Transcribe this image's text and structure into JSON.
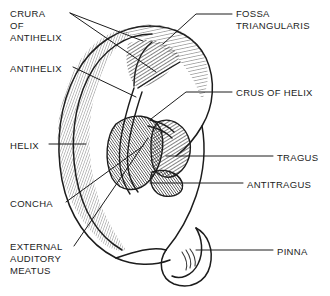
{
  "figure": {
    "kind": "anatomical-line-drawing",
    "background_color": "#ffffff",
    "ink_color": "#1c1c1c",
    "text_color": "#1c1c1c"
  },
  "labels": [
    {
      "id": "crura-of-antihelix",
      "text": "CRURA\nOF\nANTIHELIX",
      "side": "left",
      "x": 10,
      "y": 8
    },
    {
      "id": "antihelix",
      "text": "ANTIHELIX",
      "side": "left",
      "x": 10,
      "y": 63
    },
    {
      "id": "helix",
      "text": "HELIX",
      "side": "left",
      "x": 10,
      "y": 140
    },
    {
      "id": "concha",
      "text": "CONCHA",
      "side": "left",
      "x": 10,
      "y": 198
    },
    {
      "id": "external-auditory-meatus",
      "text": "EXTERNAL\nAUDITORY\nMEATUS",
      "side": "left",
      "x": 10,
      "y": 241
    },
    {
      "id": "fossa-triangularis",
      "text": "FOSSA\nTRIANGULARIS",
      "side": "right",
      "x": 236,
      "y": 8
    },
    {
      "id": "crus-of-helix",
      "text": "CRUS OF HELIX",
      "side": "right",
      "x": 236,
      "y": 87
    },
    {
      "id": "tragus",
      "text": "TRAGUS",
      "side": "right",
      "x": 277,
      "y": 152
    },
    {
      "id": "antitragus",
      "text": "ANTITRAGUS",
      "side": "right",
      "x": 247,
      "y": 179
    },
    {
      "id": "pinna",
      "text": "PINNA",
      "side": "right",
      "x": 277,
      "y": 246
    }
  ],
  "leader_lines": [
    {
      "id": "leader-crura-upper",
      "from": "crura-of-antihelix",
      "points": "70,13 143,41"
    },
    {
      "id": "leader-crura-lower",
      "from": "crura-of-antihelix",
      "points": "70,13 156,72"
    },
    {
      "id": "leader-antihelix",
      "from": "antihelix",
      "points": "73,67 136,97"
    },
    {
      "id": "leader-helix",
      "from": "helix",
      "points": "49,144 86,144"
    },
    {
      "id": "leader-concha",
      "from": "concha",
      "points": "66,202 143,146"
    },
    {
      "id": "leader-eam",
      "from": "external-auditory-meatus",
      "points": "74,246 148,138"
    },
    {
      "id": "leader-fossa",
      "from": "fossa-triangularis",
      "points": "232,14 196,14 163,44"
    },
    {
      "id": "leader-crus",
      "from": "crus-of-helix",
      "points": "232,92 186,92 151,119"
    },
    {
      "id": "leader-tragus",
      "from": "tragus",
      "points": "273,156 166,156"
    },
    {
      "id": "leader-antitragus",
      "from": "antitragus",
      "points": "243,183 150,183"
    },
    {
      "id": "leader-pinna",
      "from": "pinna",
      "points": "273,250 196,250"
    }
  ]
}
